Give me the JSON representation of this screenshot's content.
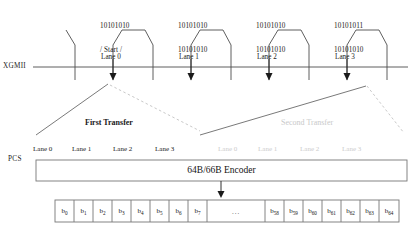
{
  "diagram": {
    "xgmii_row_label": "XGMII",
    "pcs_row_label": "PCS",
    "encoder_label": "64B/66B Encoder",
    "ellipsis": "...",
    "colors": {
      "line": "#4d4d4d",
      "text": "#1a1a1a",
      "faded": "#cccccc",
      "box_border": "#777777"
    }
  },
  "byte_labels": [
    {
      "line1": "10101010",
      "line2": "/ Start /",
      "x": 100,
      "y": 6
    },
    {
      "line1": "10101010",
      "line2": "10101010",
      "x": 178,
      "y": 6
    },
    {
      "line1": "10101010",
      "line2": "10101010",
      "x": 256,
      "y": 6
    },
    {
      "line1": "10101011",
      "line2": "10101010",
      "x": 334,
      "y": 6
    }
  ],
  "xgmii_lanes": [
    {
      "label": "Lane 0",
      "x": 101,
      "arrow_x": 113
    },
    {
      "label": "Lane 1",
      "x": 179,
      "arrow_x": 191
    },
    {
      "label": "Lane 2",
      "x": 257,
      "arrow_x": 269
    },
    {
      "label": "Lane 3",
      "x": 335,
      "arrow_x": 347
    }
  ],
  "transfers": [
    {
      "label": "First Transfer",
      "x": 85,
      "y": 122,
      "faded": false
    },
    {
      "label": "Second Transfer",
      "x": 281,
      "y": 122,
      "faded": true
    }
  ],
  "pcs_lanes_first": [
    {
      "label": "Lane 0",
      "x": 33
    },
    {
      "label": "Lane 1",
      "x": 72
    },
    {
      "label": "Lane 2",
      "x": 113
    },
    {
      "label": "Lane 3",
      "x": 155
    }
  ],
  "pcs_lanes_second": [
    {
      "label": "Lane 0",
      "x": 218
    },
    {
      "label": "Lane 1",
      "x": 258
    },
    {
      "label": "Lane 2",
      "x": 300
    },
    {
      "label": "Lane 3",
      "x": 342
    }
  ],
  "bits_left": [
    {
      "name": "b",
      "index": "0"
    },
    {
      "name": "b",
      "index": "1"
    },
    {
      "name": "b",
      "index": "2"
    },
    {
      "name": "b",
      "index": "3"
    },
    {
      "name": "b",
      "index": "4"
    },
    {
      "name": "b",
      "index": "5"
    },
    {
      "name": "b",
      "index": "6"
    },
    {
      "name": "b",
      "index": "7"
    }
  ],
  "bits_right": [
    {
      "name": "b",
      "index": "58"
    },
    {
      "name": "b",
      "index": "59"
    },
    {
      "name": "b",
      "index": "60"
    },
    {
      "name": "b",
      "index": "61"
    },
    {
      "name": "b",
      "index": "62"
    },
    {
      "name": "b",
      "index": "63"
    },
    {
      "name": "b",
      "index": "64"
    },
    {
      "name": "b",
      "index": "65"
    }
  ]
}
